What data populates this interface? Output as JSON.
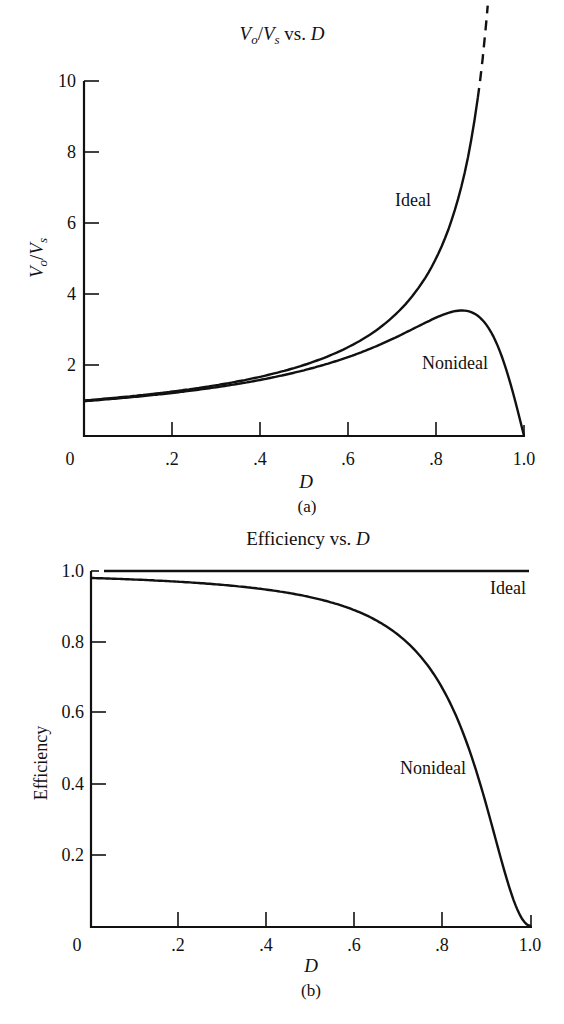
{
  "chart_data": [
    {
      "id": "a",
      "type": "line",
      "title": "Vo/Vs vs. D",
      "title_parts": {
        "v1": "V",
        "s1": "o",
        "slash": "/",
        "v2": "V",
        "s2": "s",
        "rest": " vs. ",
        "d": "D"
      },
      "xlabel": "D",
      "ylabel": "Vo/Vs",
      "ylabel_parts": {
        "v1": "V",
        "s1": "o",
        "slash": "/",
        "v2": "V",
        "s2": "s"
      },
      "caption": "(a)",
      "xlim": [
        0,
        1.0
      ],
      "ylim": [
        0,
        10
      ],
      "x_ticks": [
        "0",
        ".2",
        ".4",
        ".6",
        ".8",
        "1.0"
      ],
      "y_ticks": [
        "2",
        "4",
        "6",
        "8",
        "10"
      ],
      "grid": false,
      "x": [
        0,
        0.1,
        0.2,
        0.3,
        0.4,
        0.5,
        0.6,
        0.7,
        0.8,
        0.85,
        0.86,
        0.9,
        0.95,
        0.98,
        1.0
      ],
      "series": [
        {
          "name": "Ideal",
          "label": "Ideal",
          "values": [
            1.0,
            1.11,
            1.25,
            1.43,
            1.67,
            2.0,
            2.5,
            3.33,
            5.0,
            6.67,
            7.14,
            10.0,
            null,
            null,
            null
          ],
          "note": "solid to D≈0.895 (≈9.2), dashed above"
        },
        {
          "name": "Nonideal",
          "label": "Nonideal",
          "values": [
            0.98,
            1.09,
            1.21,
            1.38,
            1.59,
            1.85,
            2.22,
            2.73,
            3.33,
            3.43,
            3.44,
            3.33,
            2.0,
            0.91,
            0
          ]
        }
      ]
    },
    {
      "id": "b",
      "type": "line",
      "title": "Efficiency vs. D",
      "title_parts": {
        "text": "Efficiency vs. ",
        "d": "D"
      },
      "xlabel": "D",
      "ylabel": "Efficiency",
      "caption": "(b)",
      "xlim": [
        0,
        1.0
      ],
      "ylim": [
        0,
        1.0
      ],
      "x_ticks": [
        "0",
        ".2",
        ".4",
        ".6",
        ".8",
        "1.0"
      ],
      "y_ticks": [
        "0.2",
        "0.4",
        "0.6",
        "0.8",
        "1.0"
      ],
      "grid": false,
      "x": [
        0,
        0.1,
        0.2,
        0.3,
        0.4,
        0.5,
        0.6,
        0.7,
        0.8,
        0.85,
        0.9,
        0.95,
        0.98,
        1.0
      ],
      "series": [
        {
          "name": "Ideal",
          "label": "Ideal",
          "values": [
            1.0,
            1.0,
            1.0,
            1.0,
            1.0,
            1.0,
            1.0,
            1.0,
            1.0,
            1.0,
            1.0,
            1.0,
            1.0,
            1.0
          ]
        },
        {
          "name": "Nonideal",
          "label": "Nonideal",
          "values": [
            0.98,
            0.976,
            0.97,
            0.961,
            0.947,
            0.926,
            0.889,
            0.818,
            0.667,
            0.529,
            0.333,
            0.111,
            0.02,
            0
          ]
        }
      ]
    }
  ]
}
